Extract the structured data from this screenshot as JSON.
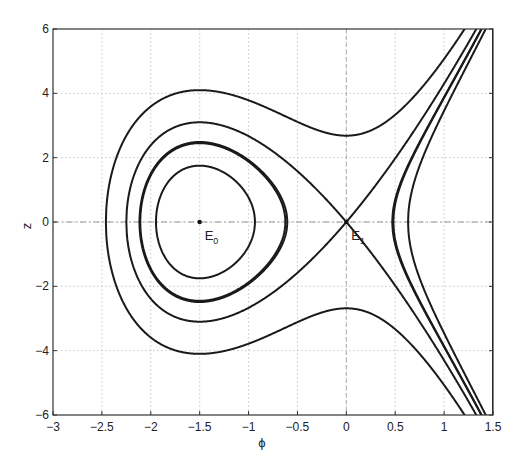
{
  "chart_data": {
    "type": "line",
    "title": "",
    "xlabel": "ϕ",
    "ylabel": "z",
    "xlim": [
      -3,
      1.5
    ],
    "ylim": [
      -6,
      6
    ],
    "xticks": [
      -3,
      -2.5,
      -2,
      -1.5,
      -1,
      -0.5,
      0,
      0.5,
      1,
      1.5
    ],
    "xtick_labels": [
      "−3",
      "−2.5",
      "−2",
      "−1.5",
      "−1",
      "−0.5",
      "0",
      "0.5",
      "1",
      "1.5"
    ],
    "yticks": [
      -6,
      -4,
      -2,
      0,
      2,
      4,
      6
    ],
    "ytick_labels": [
      "−6",
      "−4",
      "−2",
      "0",
      "2",
      "4",
      "6"
    ],
    "grid": true,
    "legend": null,
    "potential_c": 8.54,
    "series": [
      {
        "name": "orbit-inner",
        "energy": -3.27,
        "closed": true,
        "z_at_center": 1.75,
        "phi_range": [
          -1.95,
          -0.94
        ]
      },
      {
        "name": "orbit-middle",
        "energy": -1.8,
        "closed": true,
        "z_at_center": 2.45,
        "phi_range": [
          -2.1,
          -0.62
        ]
      },
      {
        "name": "separatrix",
        "energy": 0.0,
        "closed": false,
        "z_at_center": 3.1,
        "phi_range": [
          -2.25,
          1.5
        ]
      },
      {
        "name": "outer-unbounded",
        "energy": 3.6,
        "closed": false,
        "z_at_center": 4.1,
        "z_at_phi0": 2.68,
        "phi_range": [
          -2.44,
          1.5
        ]
      },
      {
        "name": "right-branch",
        "energy": -1.71,
        "closed": false,
        "vertex_phi": 0.47,
        "phi_range": [
          0.47,
          1.5
        ]
      }
    ],
    "points": [
      {
        "name": "E0",
        "label": "E",
        "subscript": "0",
        "x": -1.5,
        "y": 0
      },
      {
        "name": "E1",
        "label": "E",
        "subscript": "1",
        "x": 0,
        "y": 0
      }
    ]
  }
}
